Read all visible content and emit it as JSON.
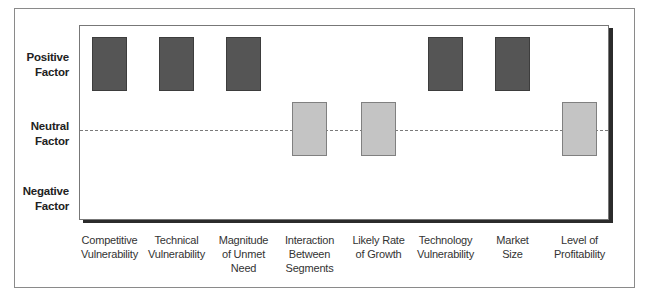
{
  "chart_data": {
    "type": "bar",
    "subtype": "categorical-factor-rating",
    "title": "",
    "xlabel": "",
    "ylabel": "",
    "y_levels": [
      "Positive Factor",
      "Neutral Factor",
      "Negative Factor"
    ],
    "categories": [
      "Competitive Vulnerability",
      "Technical Vulnerability",
      "Magnitude of Unmet Need",
      "Interaction Between Segments",
      "Likely Rate of Growth",
      "Technology Vulnerability",
      "Market Size",
      "Level of Profitability"
    ],
    "values": [
      "Positive",
      "Positive",
      "Positive",
      "Neutral",
      "Neutral",
      "Positive",
      "Positive",
      "Neutral"
    ],
    "numeric_values": [
      1,
      1,
      1,
      0,
      0,
      1,
      1,
      0
    ],
    "ylim": [
      -1,
      1
    ],
    "reference_line": {
      "level": "Neutral",
      "style": "dashed"
    },
    "grid": false,
    "legend": null
  },
  "colors": {
    "positive": "#555555",
    "neutral": "#c4c4c4",
    "reference_line": "#7a7a7a"
  },
  "y_axis": {
    "positive": [
      "Positive",
      "Factor"
    ],
    "neutral": [
      "Neutral",
      "Factor"
    ],
    "negative": [
      "Negative",
      "Factor"
    ]
  },
  "x_axis": [
    {
      "lines": [
        "Competitive",
        "Vulnerability"
      ],
      "level": "positive"
    },
    {
      "lines": [
        "Technical",
        "Vulnerability"
      ],
      "level": "positive"
    },
    {
      "lines": [
        "Magnitude",
        "of Unmet",
        "Need"
      ],
      "level": "positive"
    },
    {
      "lines": [
        "Interaction",
        "Between",
        "Segments"
      ],
      "level": "neutral"
    },
    {
      "lines": [
        "Likely Rate",
        "of Growth"
      ],
      "level": "neutral"
    },
    {
      "lines": [
        "Technology",
        "Vulnerability"
      ],
      "level": "positive"
    },
    {
      "lines": [
        "Market",
        "Size"
      ],
      "level": "positive"
    },
    {
      "lines": [
        "Level of",
        "Profitability"
      ],
      "level": "neutral"
    }
  ]
}
